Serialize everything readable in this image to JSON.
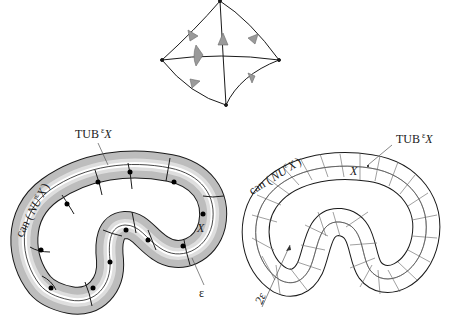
{
  "figure": {
    "top_diagram": {
      "description": "curvilinear quadrilateral with crossing arcs and shaded arrow markers"
    },
    "left_diagram": {
      "labels": {
        "tub_main": "TUB",
        "tub_sup": "ε",
        "tub_var": "X",
        "can_prefix": "can (",
        "can_var": "NU",
        "can_sup": "ε",
        "can_x": "X",
        "can_suffix": ")",
        "x_label": "X",
        "epsilon": "ε"
      }
    },
    "right_diagram": {
      "labels": {
        "tub_main": "TUB",
        "tub_sup": "ε",
        "tub_var": "X",
        "can_prefix": "can (",
        "can_var": "NU",
        "can_sup": "ε",
        "can_x": "X",
        "can_suffix": ")",
        "x_label": "X",
        "two_epsilon": "2ε"
      }
    },
    "colors": {
      "stroke": "#1a1a1a",
      "fill_band": "#c8c8c8",
      "fill_inner": "#e6e6e6"
    }
  }
}
